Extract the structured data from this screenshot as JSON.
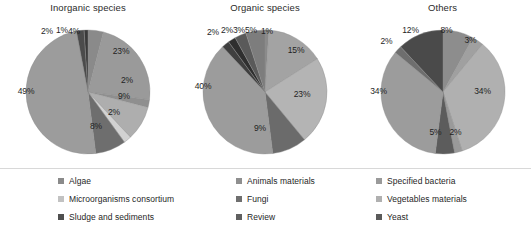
{
  "chart_data": [
    {
      "type": "pie",
      "title": "Inorganic species",
      "labels": [
        "Algae",
        "Animals materials",
        "Specified bacteria",
        "Microorganisms consortium",
        "Fungi",
        "Vegetables materials",
        "Sludge and sediments",
        "Review",
        "Yeast"
      ],
      "values": [
        4,
        23,
        2,
        9,
        2,
        8,
        49,
        2,
        1
      ],
      "data_labels": [
        "4%",
        "23%",
        "2%",
        "9%",
        "2%",
        "8%",
        "49%",
        "2%",
        "1%"
      ],
      "colors": [
        "#8a8a8a",
        "#9a9a9a",
        "#8f8f8f",
        "#aeaeae",
        "#d2d2d2",
        "#6e6e6e",
        "#9c9c9c",
        "#4b4b4b",
        "#3a3a3a"
      ],
      "legend": "shared-bottom"
    },
    {
      "type": "pie",
      "title": "Organic species",
      "labels": [
        "Algae",
        "Animals materials",
        "Specified bacteria",
        "Microorganisms consortium",
        "Fungi",
        "Vegetables materials",
        "Sludge and sediments",
        "Review",
        "Yeast"
      ],
      "values": [
        1,
        15,
        23,
        9,
        40,
        2,
        2,
        3,
        5
      ],
      "data_labels": [
        "1%",
        "15%",
        "23%",
        "9%",
        "40%",
        "2%",
        "2%",
        "3%",
        "5%"
      ],
      "colors": [
        "#8a8a8a",
        "#a3a3a3",
        "#b4b4b4",
        "#6b6b6b",
        "#9c9c9c",
        "#3f3f3f",
        "#2f2f2f",
        "#5a5a5a",
        "#7d7d7d"
      ],
      "legend": "shared-bottom"
    },
    {
      "type": "pie",
      "title": "Others",
      "labels": [
        "Algae",
        "Animals materials",
        "Specified bacteria",
        "Microorganisms consortium",
        "Fungi",
        "Vegetables materials",
        "Sludge and sediments",
        "Yeast"
      ],
      "values": [
        8,
        3,
        34,
        2,
        5,
        34,
        2,
        12
      ],
      "data_labels": [
        "8%",
        "3%",
        "34%",
        "2%",
        "5%",
        "34%",
        "2%",
        "12%"
      ],
      "colors": [
        "#8d8d8d",
        "#a0a0a0",
        "#b0b0b0",
        "#9a9a9a",
        "#5c5c5c",
        "#9c9c9c",
        "#6e6e6e",
        "#4a4a4a"
      ],
      "legend": "shared-bottom"
    }
  ],
  "charts": [
    {
      "title": "Inorganic species",
      "radius": 62,
      "start_angle": -90,
      "slices": [
        {
          "label": "4%",
          "value": 4,
          "color": "#8a8a8a",
          "lx": 50.0,
          "ly": 3.0
        },
        {
          "label": "23%",
          "value": 23,
          "color": "#9a9a9a",
          "lx": 97.0,
          "ly": 23.0
        },
        {
          "label": "2%",
          "value": 2,
          "color": "#8f8f8f",
          "lx": 103.0,
          "ly": 52.0
        },
        {
          "label": "9%",
          "value": 9,
          "color": "#aeaeae",
          "lx": 100.0,
          "ly": 68.0
        },
        {
          "label": "2%",
          "value": 2,
          "color": "#d2d2d2",
          "lx": 90.0,
          "ly": 84.0
        },
        {
          "label": "8%",
          "value": 8,
          "color": "#6e6e6e",
          "lx": 72.0,
          "ly": 98.0
        },
        {
          "label": "49%",
          "value": 49,
          "color": "#9c9c9c",
          "lx": 2.0,
          "ly": 63.0
        },
        {
          "label": "2%",
          "value": 2,
          "color": "#4b4b4b",
          "lx": 23.0,
          "ly": 3.0
        },
        {
          "label": "1%",
          "value": 1,
          "color": "#3a3a3a",
          "lx": 38.0,
          "ly": 2.0
        }
      ]
    },
    {
      "title": "Organic species",
      "radius": 62,
      "start_angle": -90,
      "slices": [
        {
          "label": "1%",
          "value": 1,
          "color": "#8a8a8a",
          "lx": 66.0,
          "ly": 3.0
        },
        {
          "label": "15%",
          "value": 15,
          "color": "#a3a3a3",
          "lx": 95.0,
          "ly": 22.0
        },
        {
          "label": "23%",
          "value": 23,
          "color": "#b4b4b4",
          "lx": 101.0,
          "ly": 66.0
        },
        {
          "label": "9%",
          "value": 9,
          "color": "#6b6b6b",
          "lx": 59.0,
          "ly": 100.0
        },
        {
          "label": "40%",
          "value": 40,
          "color": "#9c9c9c",
          "lx": 2.0,
          "ly": 58.0
        },
        {
          "label": "2%",
          "value": 2,
          "color": "#3f3f3f",
          "lx": 12.0,
          "ly": 4.0
        },
        {
          "label": "2%",
          "value": 2,
          "color": "#2f2f2f",
          "lx": 26.0,
          "ly": 2.0
        },
        {
          "label": "3%",
          "value": 3,
          "color": "#5a5a5a",
          "lx": 38.0,
          "ly": 2.0
        },
        {
          "label": "5%",
          "value": 5,
          "color": "#7d7d7d",
          "lx": 50.0,
          "ly": 2.0
        }
      ]
    },
    {
      "title": "Others",
      "radius": 62,
      "start_angle": -90,
      "slices": [
        {
          "label": "8%",
          "value": 8,
          "color": "#8d8d8d",
          "lx": 68.0,
          "ly": 2.0
        },
        {
          "label": "3%",
          "value": 3,
          "color": "#a0a0a0",
          "lx": 92.0,
          "ly": 12.0
        },
        {
          "label": "34%",
          "value": 34,
          "color": "#b0b0b0",
          "lx": 104.0,
          "ly": 63.0
        },
        {
          "label": "2%",
          "value": 2,
          "color": "#9a9a9a",
          "lx": 77.0,
          "ly": 104.0
        },
        {
          "label": "5%",
          "value": 5,
          "color": "#5c5c5c",
          "lx": 57.0,
          "ly": 104.0
        },
        {
          "label": "34%",
          "value": 34,
          "color": "#9c9c9c",
          "lx": 0.0,
          "ly": 63.0
        },
        {
          "label": "2%",
          "value": 2,
          "color": "#6e6e6e",
          "lx": 8.0,
          "ly": 13.0
        },
        {
          "label": "12%",
          "value": 12,
          "color": "#4a4a4a",
          "lx": 32.0,
          "ly": 2.0
        }
      ]
    }
  ],
  "legend": {
    "columns": [
      {
        "items": [
          {
            "label": "Algae",
            "color": "#8a8a8a"
          },
          {
            "label": "Microorganisms consortium",
            "color": "#c2c2c2"
          },
          {
            "label": "Sludge and sediments",
            "color": "#4f4f4f"
          }
        ]
      },
      {
        "items": [
          {
            "label": "Animals materials",
            "color": "#8f8f8f"
          },
          {
            "label": "Fungi",
            "color": "#6f6f6f"
          },
          {
            "label": "Review",
            "color": "#606060"
          }
        ]
      },
      {
        "items": [
          {
            "label": "Specified bacteria",
            "color": "#9a9a9a"
          },
          {
            "label": "Vegetables materials",
            "color": "#b0b0b0"
          },
          {
            "label": "Yeast",
            "color": "#5a5a5a"
          }
        ]
      }
    ]
  }
}
